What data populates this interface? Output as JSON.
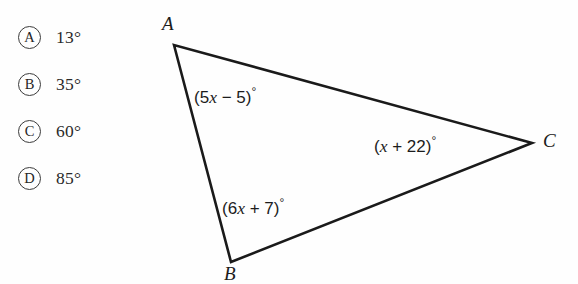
{
  "figure": {
    "type": "triangle-angle-problem",
    "stroke_color": "#1a1a1a",
    "background_color": "#fefefe",
    "vertices": [
      {
        "name": "A",
        "label": "A",
        "x": 174,
        "y": 45
      },
      {
        "name": "B",
        "label": "B",
        "x": 231,
        "y": 262
      },
      {
        "name": "C",
        "label": "C",
        "x": 532,
        "y": 143
      }
    ],
    "angle_labels": [
      {
        "at_vertex": "A",
        "expression": "(5x − 5)°",
        "prefix": "(5",
        "var": "x",
        "middle": " − 5)",
        "degree": "°"
      },
      {
        "at_vertex": "B",
        "expression": "(6x + 7)°",
        "prefix": "(6",
        "var": "x",
        "middle": " + 7)",
        "degree": "°"
      },
      {
        "at_vertex": "C",
        "expression": "(x + 22)°",
        "prefix": "(",
        "var": "x",
        "middle": " + 22)",
        "degree": "°"
      }
    ]
  },
  "choices": [
    {
      "letter": "A",
      "value": "13°"
    },
    {
      "letter": "B",
      "value": "35°"
    },
    {
      "letter": "C",
      "value": "60°"
    },
    {
      "letter": "D",
      "value": "85°"
    }
  ]
}
